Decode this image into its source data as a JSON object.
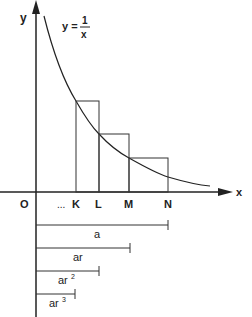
{
  "diagram": {
    "function_label": {
      "lhs": "y =",
      "numerator": "1",
      "denominator": "x"
    },
    "axes": {
      "x_label": "x",
      "y_label": "y",
      "origin_label": "O"
    },
    "x_ticks": [
      {
        "label": "...",
        "x": 64
      },
      {
        "label": "K",
        "x": 76
      },
      {
        "label": "L",
        "x": 99
      },
      {
        "label": "M",
        "x": 129
      },
      {
        "label": "N",
        "x": 168
      }
    ],
    "rectangles": [
      {
        "name": "K-L",
        "x1": 76,
        "x2": 99,
        "top": 101
      },
      {
        "name": "L-M",
        "x1": 99,
        "x2": 129,
        "top": 134
      },
      {
        "name": "M-N",
        "x1": 129,
        "x2": 168,
        "top": 158
      }
    ],
    "segments": [
      {
        "label": "a",
        "y": 225,
        "end": 168
      },
      {
        "label": "ar",
        "y": 248,
        "end": 130
      },
      {
        "label": "ar",
        "sup": "2",
        "y": 271,
        "end": 99
      },
      {
        "label": "ar",
        "sup": "3",
        "y": 294,
        "end": 75
      }
    ]
  }
}
